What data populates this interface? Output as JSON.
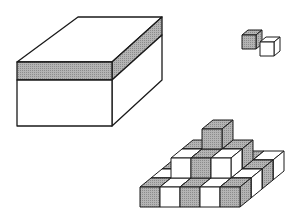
{
  "figure": {
    "colors": {
      "stroke": "#1a1a1a",
      "shade": "#a8a8a8",
      "white": "#ffffff"
    },
    "objects": [
      {
        "name": "large-box",
        "shaded_band": true
      },
      {
        "name": "cube-pair",
        "cubes": [
          "shaded",
          "white"
        ]
      },
      {
        "name": "cube-pyramid",
        "layers": [
          {
            "cols": 5,
            "rows": 4
          },
          {
            "cols": 3,
            "rows": 2
          },
          {
            "cols": 1,
            "rows": 1
          }
        ]
      }
    ]
  }
}
